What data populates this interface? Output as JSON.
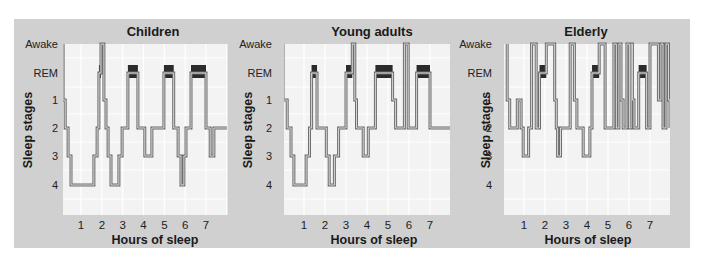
{
  "figure": {
    "background": "#d0d0d0",
    "plot_background": "#f3f3f3",
    "grid_color": "#ffffff",
    "trace_color": "#6e6e6e",
    "rem_color": "#2b2b2b"
  },
  "chart_data": [
    {
      "type": "line",
      "subtype": "hypnogram-step",
      "title": "Children",
      "xlabel": "Hours of sleep",
      "ylabel": "Sleep stages",
      "y_ticks": [
        "Awake",
        "REM",
        "1",
        "2",
        "3",
        "4"
      ],
      "x_ticks": [
        "1",
        "2",
        "3",
        "4",
        "5",
        "6",
        "7"
      ],
      "xlim": [
        0.14,
        8.0
      ],
      "grid": true,
      "steps": [
        [
          0.14,
          "Awake"
        ],
        [
          0.14,
          "1"
        ],
        [
          0.24,
          "2"
        ],
        [
          0.38,
          "3"
        ],
        [
          0.52,
          "4"
        ],
        [
          1.62,
          "3"
        ],
        [
          1.77,
          "2"
        ],
        [
          1.86,
          "REM"
        ],
        [
          1.96,
          "Awake"
        ],
        [
          2.1,
          "1"
        ],
        [
          2.2,
          "2"
        ],
        [
          2.3,
          "3"
        ],
        [
          2.44,
          "4"
        ],
        [
          2.82,
          "3"
        ],
        [
          2.97,
          "2"
        ],
        [
          3.25,
          "REM"
        ],
        [
          3.73,
          "2"
        ],
        [
          4.06,
          "3"
        ],
        [
          4.4,
          "2"
        ],
        [
          4.98,
          "REM"
        ],
        [
          5.45,
          "2"
        ],
        [
          5.66,
          "3"
        ],
        [
          5.8,
          "4"
        ],
        [
          5.94,
          "3"
        ],
        [
          6.04,
          "2"
        ],
        [
          6.28,
          "REM"
        ],
        [
          7.0,
          "2"
        ],
        [
          7.2,
          "3"
        ],
        [
          7.38,
          "2"
        ],
        [
          8.0,
          "2"
        ]
      ],
      "rem_blocks": [
        [
          1.86,
          1.96
        ],
        [
          3.25,
          3.73
        ],
        [
          4.98,
          5.45
        ],
        [
          6.28,
          7.0
        ]
      ]
    },
    {
      "type": "line",
      "subtype": "hypnogram-step",
      "title": "Young adults",
      "xlabel": "Hours of sleep",
      "ylabel": "Sleep stages",
      "y_ticks": [
        "Awake",
        "REM",
        "1",
        "2",
        "3",
        "4"
      ],
      "x_ticks": [
        "1",
        "2",
        "3",
        "4",
        "5",
        "6",
        "7"
      ],
      "xlim": [
        0.0,
        8.0
      ],
      "grid": true,
      "steps": [
        [
          0.0,
          "Awake"
        ],
        [
          0.0,
          "1"
        ],
        [
          0.2,
          "2"
        ],
        [
          0.38,
          "3"
        ],
        [
          0.52,
          "4"
        ],
        [
          1.1,
          "3"
        ],
        [
          1.26,
          "2"
        ],
        [
          1.36,
          "REM"
        ],
        [
          1.62,
          "2"
        ],
        [
          2.06,
          "3"
        ],
        [
          2.2,
          "4"
        ],
        [
          2.45,
          "3"
        ],
        [
          2.65,
          "2"
        ],
        [
          3.0,
          "REM"
        ],
        [
          3.3,
          "Awake"
        ],
        [
          3.42,
          "1"
        ],
        [
          3.5,
          "2"
        ],
        [
          3.82,
          "3"
        ],
        [
          4.06,
          "2"
        ],
        [
          4.4,
          "REM"
        ],
        [
          5.22,
          "1"
        ],
        [
          5.36,
          "2"
        ],
        [
          5.78,
          "Awake"
        ],
        [
          5.96,
          "2"
        ],
        [
          6.36,
          "REM"
        ],
        [
          7.0,
          "2"
        ],
        [
          8.0,
          "2"
        ]
      ],
      "rem_blocks": [
        [
          1.36,
          1.62
        ],
        [
          3.0,
          3.3
        ],
        [
          4.4,
          5.22
        ],
        [
          6.36,
          7.0
        ]
      ]
    },
    {
      "type": "line",
      "subtype": "hypnogram-step",
      "title": "Elderly",
      "xlabel": "Hours of sleep",
      "ylabel": "Sleep stages",
      "y_ticks": [
        "Awake",
        "REM",
        "1",
        "2",
        "3",
        "4"
      ],
      "x_ticks": [
        "1",
        "2",
        "3",
        "4",
        "5",
        "6",
        "7"
      ],
      "xlim": [
        0.05,
        7.95
      ],
      "grid": true,
      "steps": [
        [
          0.2,
          "Awake"
        ],
        [
          0.2,
          "1"
        ],
        [
          0.32,
          "2"
        ],
        [
          0.68,
          "1"
        ],
        [
          0.86,
          "2"
        ],
        [
          0.96,
          "3"
        ],
        [
          1.22,
          "2"
        ],
        [
          1.36,
          "Awake"
        ],
        [
          1.58,
          "2"
        ],
        [
          1.74,
          "REM"
        ],
        [
          2.06,
          "Awake"
        ],
        [
          2.46,
          "1"
        ],
        [
          2.54,
          "2"
        ],
        [
          2.6,
          "3"
        ],
        [
          2.74,
          "2"
        ],
        [
          3.2,
          "Awake"
        ],
        [
          3.4,
          "1"
        ],
        [
          3.52,
          "2"
        ],
        [
          3.82,
          "3"
        ],
        [
          4.14,
          "2"
        ],
        [
          4.24,
          "REM"
        ],
        [
          4.58,
          "Awake"
        ],
        [
          4.86,
          "2"
        ],
        [
          5.28,
          "Awake"
        ],
        [
          5.4,
          "2"
        ],
        [
          5.52,
          "Awake"
        ],
        [
          5.62,
          "1"
        ],
        [
          5.72,
          "2"
        ],
        [
          5.9,
          "Awake"
        ],
        [
          6.02,
          "2"
        ],
        [
          6.1,
          "Awake"
        ],
        [
          6.16,
          "1"
        ],
        [
          6.24,
          "2"
        ],
        [
          6.46,
          "REM"
        ],
        [
          6.84,
          "2"
        ],
        [
          7.0,
          "Awake"
        ],
        [
          7.4,
          "1"
        ],
        [
          7.52,
          "Awake"
        ],
        [
          7.62,
          "2"
        ],
        [
          7.76,
          "Awake"
        ],
        [
          7.88,
          "1"
        ],
        [
          7.98,
          "2"
        ],
        [
          8.35,
          "2"
        ]
      ],
      "rem_blocks": [
        [
          1.74,
          2.06
        ],
        [
          4.24,
          4.58
        ],
        [
          6.46,
          6.84
        ]
      ]
    }
  ]
}
